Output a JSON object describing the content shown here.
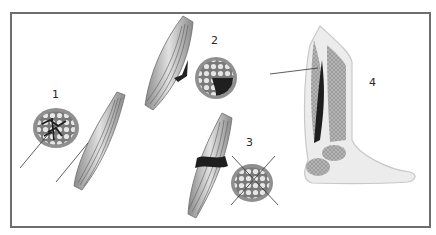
{
  "figure": {
    "panels": [
      {
        "id": "1",
        "label": "1",
        "description": "cross-section with dark interstitial network and fusiform muscle, arrows"
      },
      {
        "id": "2",
        "label": "2",
        "description": "muscle with dark lateral lesion and cross-section with dark sector"
      },
      {
        "id": "3",
        "label": "3",
        "description": "muscle with dark transverse band and crossed cross-section"
      },
      {
        "id": "4",
        "label": "4",
        "description": "sagittal view of lower leg and foot with dark calf muscle region, arrow"
      }
    ],
    "colors": {
      "frame": "#6e6e6e",
      "muscle_light": "#d9d9d9",
      "muscle_mid": "#9a9a9a",
      "muscle_dark": "#2b2b2b",
      "fibers": "#555555",
      "leg_outline": "#c8c8c8",
      "leg_fill": "#ececec",
      "bone_hatch": "#a8a8a8"
    }
  }
}
